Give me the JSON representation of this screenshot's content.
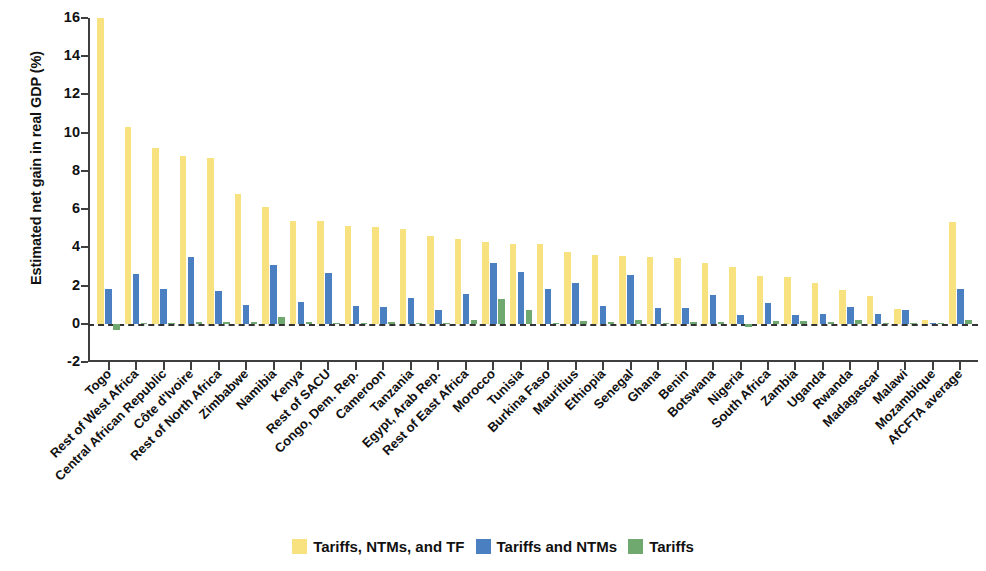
{
  "chart_data": {
    "type": "bar",
    "title": "",
    "xlabel": "",
    "ylabel": "Estimated net gain in real GDP (%)",
    "ylim": [
      -2,
      16
    ],
    "yticks": [
      -2,
      0,
      2,
      4,
      6,
      8,
      10,
      12,
      14,
      16
    ],
    "grid": false,
    "legend_position": "bottom",
    "categories": [
      "Togo",
      "Rest of West Africa",
      "Central African Republic",
      "Côte d'Ivoire",
      "Rest of North Africa",
      "Zimbabwe",
      "Namibia",
      "Kenya",
      "Rest of SACU",
      "Congo, Dem. Rep.",
      "Cameroon",
      "Tanzania",
      "Egypt, Arab Rep.",
      "Rest of East Africa",
      "Morocco",
      "Tunisia",
      "Burkina Faso",
      "Mauritius",
      "Ethiopia",
      "Senegal",
      "Ghana",
      "Benin",
      "Botswana",
      "Nigeria",
      "South Africa",
      "Zambia",
      "Uganda",
      "Rwanda",
      "Madagascar",
      "Malawi",
      "Mozambique",
      "AfCFTA average"
    ],
    "series": [
      {
        "name": "Tariffs, NTMs, and TF",
        "color": "#F7E27F",
        "values": [
          16.0,
          10.3,
          9.2,
          8.8,
          8.7,
          6.8,
          6.1,
          5.4,
          5.4,
          5.1,
          5.05,
          4.95,
          4.6,
          4.45,
          4.3,
          4.2,
          4.2,
          3.75,
          3.6,
          3.55,
          3.5,
          3.45,
          3.2,
          2.95,
          2.5,
          2.45,
          2.15,
          1.75,
          1.45,
          0.75,
          0.2,
          5.3
        ]
      },
      {
        "name": "Tariffs and NTMs",
        "color": "#4A7FC1",
        "values": [
          1.8,
          2.6,
          1.8,
          3.5,
          1.7,
          1.0,
          3.05,
          1.15,
          2.65,
          0.95,
          0.9,
          1.35,
          0.7,
          1.55,
          3.2,
          2.7,
          1.8,
          2.15,
          0.95,
          2.55,
          0.85,
          0.85,
          1.5,
          0.45,
          1.1,
          0.45,
          0.5,
          0.9,
          0.5,
          0.7,
          0.05,
          1.8
        ]
      },
      {
        "name": "Tariffs",
        "color": "#6FA96F",
        "values": [
          -0.35,
          0.05,
          0.05,
          0.1,
          0.1,
          0.1,
          0.35,
          0.1,
          0.05,
          0.05,
          0.1,
          0.05,
          0.05,
          0.2,
          1.3,
          0.7,
          0.05,
          0.15,
          0.1,
          0.2,
          0.05,
          0.1,
          0.1,
          -0.15,
          0.15,
          0.15,
          0.1,
          0.2,
          0.05,
          0.02,
          0.02,
          0.2
        ]
      }
    ]
  },
  "legend": {
    "items": [
      {
        "label": "Tariffs, NTMs, and TF",
        "color": "#F7E27F"
      },
      {
        "label": "Tariffs and NTMs",
        "color": "#4A7FC1"
      },
      {
        "label": "Tariffs",
        "color": "#6FA96F"
      }
    ]
  }
}
